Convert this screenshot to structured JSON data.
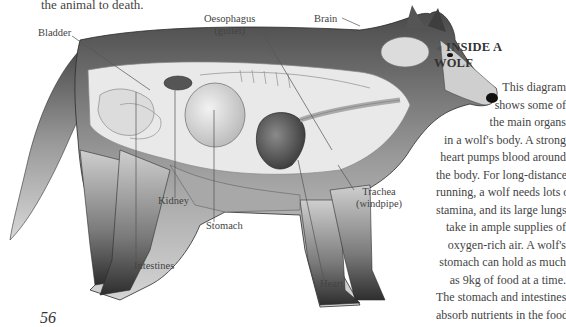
{
  "intro_text": "the animal to death.",
  "diagram": {
    "labels": {
      "bladder": "Bladder",
      "oesophagus": "Oesophagus",
      "oesophagus_alt": "(gullet)",
      "brain": "Brain",
      "kidney": "Kidney",
      "stomach": "Stomach",
      "intestines": "Intestines",
      "heart": "Heart",
      "trachea": "Trachea",
      "trachea_alt": "(windpipe)"
    }
  },
  "caption": {
    "arrow": "◄",
    "title_line1": "INSIDE A",
    "title_line2": "WOLF",
    "lines": [
      "This diagram",
      "shows some of",
      "the main organs",
      "in a wolf's body. A strong",
      "heart pumps blood around",
      "the body. For long-distance",
      "running, a wolf needs lots of",
      "stamina, and its large lungs",
      "take in ample supplies of",
      "oxygen-rich air. A wolf's",
      "stomach can hold as much",
      "as 9kg of food at a time.",
      "The stomach and intestines",
      "absorb nutrients in the food."
    ]
  },
  "page_number": "56"
}
